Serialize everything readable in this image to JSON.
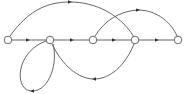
{
  "diagram": {
    "type": "directed-graph",
    "colors": {
      "stroke": "#555555",
      "node_fill": "#ffffff",
      "background": "#ffffff"
    },
    "nodes": [
      {
        "id": "n1",
        "x": 8,
        "y": 40
      },
      {
        "id": "n2",
        "x": 50,
        "y": 40
      },
      {
        "id": "n3",
        "x": 93,
        "y": 40
      },
      {
        "id": "n4",
        "x": 135,
        "y": 40
      },
      {
        "id": "n5",
        "x": 178,
        "y": 40
      }
    ],
    "edges": [
      {
        "id": "e1",
        "from": "n1",
        "to": "n2",
        "shape": "straight"
      },
      {
        "id": "e2",
        "from": "n2",
        "to": "n3",
        "shape": "straight"
      },
      {
        "id": "e3",
        "from": "n3",
        "to": "n4",
        "shape": "straight"
      },
      {
        "id": "e4",
        "from": "n4",
        "to": "n5",
        "shape": "straight"
      },
      {
        "id": "e5",
        "from": "n1",
        "to": "n4",
        "shape": "arc-above"
      },
      {
        "id": "e6",
        "from": "n3",
        "to": "n5",
        "shape": "arc-above"
      },
      {
        "id": "e7",
        "from": "n4",
        "to": "n2",
        "shape": "arc-below"
      },
      {
        "id": "e8",
        "from": "n2",
        "to": "n2",
        "shape": "self-loop-below"
      }
    ]
  }
}
